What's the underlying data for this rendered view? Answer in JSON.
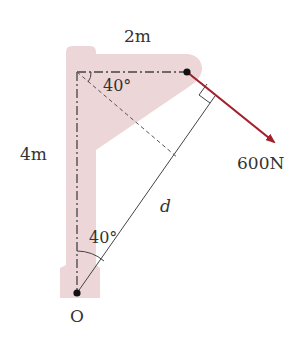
{
  "labels": {
    "top_length": "2m",
    "left_length": "4m",
    "top_angle": "40°",
    "bottom_angle": "40°",
    "force": "600N",
    "distance": "d",
    "origin": "O"
  },
  "colors": {
    "frame_fill": "#ecd6d8",
    "force_arrow": "#a3202d",
    "line": "#444444",
    "text": "#333333"
  }
}
